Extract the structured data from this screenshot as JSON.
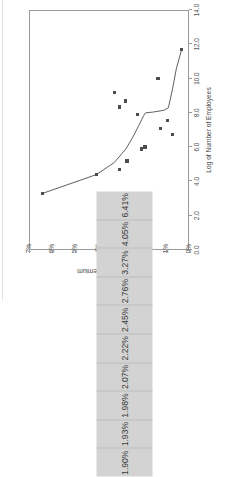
{
  "chart_data": {
    "type": "scatter",
    "title": "Smoothed Premium over CAPM vs. Unadjusted Premium over CAPM",
    "xlabel": "Log of Number of Employees",
    "ylabel": "Equity Premium",
    "xlim": [
      0.0,
      14.0
    ],
    "ylim": [
      0,
      7
    ],
    "xticks": [
      "0.0",
      "2.0",
      "4.0",
      "6.0",
      "8.0",
      "10.0",
      "12.0",
      "14.0"
    ],
    "xtick_values": [
      0.0,
      2.0,
      4.0,
      6.0,
      8.0,
      10.0,
      12.0,
      14.0
    ],
    "yticks": [
      "0%",
      "1%",
      "2%",
      "3%",
      "4%",
      "5%",
      "6%",
      "7%"
    ],
    "ytick_values": [
      0,
      1,
      2,
      3,
      4,
      5,
      6,
      7
    ],
    "grid": false,
    "legend": "none",
    "series": [
      {
        "name": "Unadjusted Premium over CAPM",
        "type": "scatter",
        "marker": "square",
        "color": "#4d4d4d",
        "points": [
          {
            "x": 3.3,
            "y": 6.41
          },
          {
            "x": 4.4,
            "y": 4.05
          },
          {
            "x": 4.7,
            "y": 3.05
          },
          {
            "x": 5.2,
            "y": 2.72
          },
          {
            "x": 5.9,
            "y": 2.08
          },
          {
            "x": 6.0,
            "y": 1.93
          },
          {
            "x": 6.75,
            "y": 0.72
          },
          {
            "x": 7.1,
            "y": 1.26
          },
          {
            "x": 7.55,
            "y": 0.95
          },
          {
            "x": 7.9,
            "y": 2.25
          },
          {
            "x": 8.35,
            "y": 3.05
          },
          {
            "x": 8.7,
            "y": 2.77
          },
          {
            "x": 9.2,
            "y": 3.25
          },
          {
            "x": 10.0,
            "y": 1.35
          },
          {
            "x": 11.7,
            "y": 0.32
          }
        ]
      },
      {
        "name": "Smoothed Premium over CAPM",
        "type": "line",
        "color": "#4d4d4d",
        "points": [
          {
            "x": 3.3,
            "y": 6.41
          },
          {
            "x": 4.4,
            "y": 4.05
          },
          {
            "x": 5.1,
            "y": 3.27
          },
          {
            "x": 5.9,
            "y": 2.76
          },
          {
            "x": 6.6,
            "y": 2.45
          },
          {
            "x": 7.2,
            "y": 2.22
          },
          {
            "x": 7.6,
            "y": 2.07
          },
          {
            "x": 7.85,
            "y": 1.98
          },
          {
            "x": 7.95,
            "y": 1.93
          },
          {
            "x": 8.0,
            "y": 1.9
          },
          {
            "x": 8.05,
            "y": 1.55
          },
          {
            "x": 8.15,
            "y": 1.1
          },
          {
            "x": 8.3,
            "y": 0.9
          },
          {
            "x": 9.4,
            "y": 0.72
          },
          {
            "x": 10.6,
            "y": 0.55
          },
          {
            "x": 11.7,
            "y": 0.32
          }
        ]
      }
    ]
  },
  "table": {
    "values": [
      "1.90%",
      "1.93%",
      "1.98%",
      "2.07%",
      "2.22%",
      "2.45%",
      "2.76%",
      "3.27%",
      "4.05%",
      "6.41%"
    ]
  }
}
